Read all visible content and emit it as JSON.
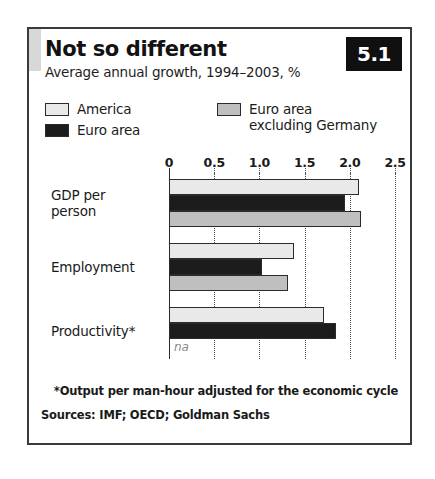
{
  "chart_data": {
    "type": "bar",
    "orientation": "horizontal",
    "title": "Not so different",
    "subtitle": "Average annual growth, 1994–2003, %",
    "badge": "5.1",
    "categories": [
      "GDP per person",
      "Employment",
      "Productivity*"
    ],
    "category_lines": [
      [
        "GDP per",
        "person"
      ],
      [
        "Employment"
      ],
      [
        "Productivity*"
      ]
    ],
    "series": [
      {
        "name": "America",
        "color": "#e9e9e9",
        "values": [
          2.1,
          1.38,
          1.72
        ]
      },
      {
        "name": "Euro area",
        "color": "#1c1c1c",
        "values": [
          1.95,
          1.03,
          1.85
        ]
      },
      {
        "name": "Euro area excluding Germany",
        "color": "#bfbfbf",
        "values": [
          2.12,
          1.32,
          null
        ],
        "value_labels": [
          null,
          null,
          "na"
        ]
      }
    ],
    "legend_entries": [
      {
        "label": "America",
        "color": "#e9e9e9",
        "column": "left"
      },
      {
        "label": "Euro area",
        "color": "#1c1c1c",
        "column": "left"
      },
      {
        "label": "Euro area\nexcluding Germany",
        "label_line1": "Euro area",
        "label_line2": "excluding Germany",
        "color": "#bfbfbf",
        "column": "right"
      }
    ],
    "xlabel": "",
    "ylabel": "",
    "xlim": [
      0,
      2.5
    ],
    "xticks": [
      0,
      0.5,
      1.0,
      1.5,
      2.0,
      2.5
    ],
    "xtick_labels": [
      "0",
      "0.5",
      "1.0",
      "1.5",
      "2.0",
      "2.5"
    ],
    "grid": "vertical-dotted",
    "legend_position": "top",
    "na_label": "na",
    "footnote": "*Output per man-hour adjusted for the economic cycle",
    "sources": "Sources: IMF; OECD; Goldman Sachs"
  },
  "colors": {
    "america": "#e9e9e9",
    "euro_area": "#1c1c1c",
    "euro_excl_germany": "#bfbfbf",
    "badge_background": "#101010",
    "badge_text": "#ffffff",
    "frame": "#3a3a3a",
    "na_text": "#8a8a8a"
  }
}
